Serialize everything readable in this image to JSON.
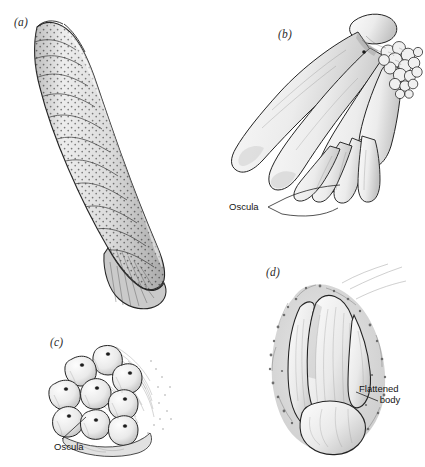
{
  "figure": {
    "background_color": "#ffffff",
    "ink_color": "#1a1a1a",
    "line_color": "#2b2b2b",
    "shade_light": "#e8e8e8",
    "shade_mid": "#cfcfcf",
    "shade_dark": "#9a9a9a",
    "type": "scientific-line-drawing",
    "panel_count": 4
  },
  "panels": [
    {
      "id": "a",
      "label": "(a)",
      "description": "Tall erect curved tubular sponge with rugose banded surface and dense stippled ostia",
      "label_x": 14,
      "label_y": 16
    },
    {
      "id": "b",
      "label": "(b)",
      "description": "Cluster of elongated finger-like lobes with oscula at tips and papillate cauliflower mass",
      "label_x": 278,
      "label_y": 28
    },
    {
      "id": "c",
      "label": "(c)",
      "description": "Low clustered mass of rounded lobes each bearing a small osculum",
      "label_x": 50,
      "label_y": 336
    },
    {
      "id": "d",
      "label": "(d)",
      "description": "Encrusting sponge with flattened body and ragged margin",
      "label_x": 266,
      "label_y": 266
    }
  ],
  "callouts": [
    {
      "id": "oscula-b",
      "panel": "b",
      "text": "Oscula",
      "lines": [
        "Oscula"
      ],
      "x": 229,
      "y": 203,
      "leaders": 2
    },
    {
      "id": "oscula-c",
      "panel": "c",
      "text": "Oscula",
      "lines": [
        "Oscula"
      ],
      "x": 54,
      "y": 441,
      "leaders": 1
    },
    {
      "id": "flattened-body-d",
      "panel": "d",
      "text": "Flattened body",
      "lines": [
        "Flattened",
        "body"
      ],
      "x": 359,
      "y": 388,
      "leaders": 1
    }
  ]
}
